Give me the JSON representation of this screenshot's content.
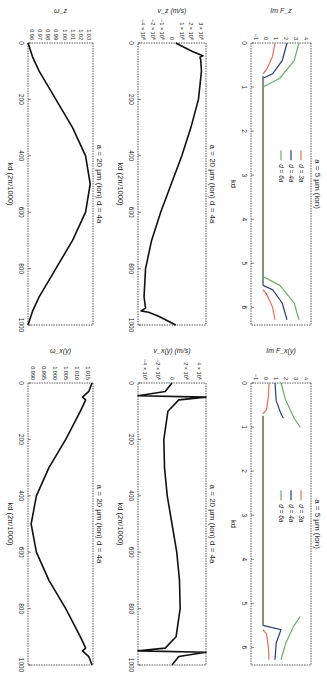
{
  "figure": {
    "orientation": "rotated 90 degrees clockwise",
    "layout": "2 rows x 3 columns"
  },
  "colors": {
    "axis": "#333333",
    "curve": "#111111",
    "d3a": "#e8705a",
    "d4a": "#2a3a7a",
    "d6a": "#6ab06a"
  },
  "chart_data": [
    {
      "id": "omega_z",
      "type": "line",
      "title": "a = 20 µm (ion) d = 4a",
      "xlabel": "kd (2π/1000)",
      "ylabel": "ω_z",
      "xlim": [
        0,
        1000
      ],
      "ylim": [
        0.96,
        1.03
      ],
      "xticks": [
        "0",
        "200",
        "400",
        "600",
        "800",
        "1000"
      ],
      "yticks": [
        "0.96",
        "0.97",
        "0.98",
        "0.99",
        "1.00",
        "1.01",
        "1.02",
        "1.03"
      ],
      "x": [
        0,
        50,
        100,
        200,
        300,
        400,
        500,
        600,
        700,
        800,
        900,
        950,
        1000
      ],
      "values": [
        0.96,
        0.965,
        0.972,
        0.99,
        1.008,
        1.022,
        1.027,
        1.022,
        1.008,
        0.99,
        0.972,
        0.965,
        0.96
      ]
    },
    {
      "id": "v_z",
      "type": "line",
      "title": "a = 20 µm (ion) d = 4a",
      "xlabel": "kd (2π/1000)",
      "ylabel": "v_z (m/s)",
      "xlim": [
        0,
        1000
      ],
      "ylim": [
        -5000000.0,
        4000000.0
      ],
      "xticks": [
        "0",
        "200",
        "400",
        "600",
        "800",
        "1000"
      ],
      "yticks": [
        "3 × 10⁶",
        "2 × 10⁶",
        "1 × 10⁶",
        "0",
        "−1 × 10⁶",
        "−2 × 10⁶",
        "−4 × 10⁶"
      ],
      "x": [
        0,
        30,
        45,
        50,
        60,
        100,
        200,
        300,
        400,
        500,
        600,
        700,
        800,
        900,
        940,
        950,
        955,
        970,
        1000
      ],
      "values": [
        0,
        2200000.0,
        3600000.0,
        3200000.0,
        3300000.0,
        3400000.0,
        3000000.0,
        2000000.0,
        800000.0,
        -600000.0,
        -2000000.0,
        -3200000.0,
        -4000000.0,
        -4200000.0,
        -4000000.0,
        -4600000.0,
        -3600000.0,
        -2200000.0,
        0
      ]
    },
    {
      "id": "im_F_z",
      "type": "line",
      "title": "a = 5 µm (ion)",
      "xlabel": "kd",
      "ylabel": "Im F_z",
      "xlim": [
        0,
        6.4
      ],
      "ylim": [
        -1,
        4
      ],
      "xticks": [
        "0",
        "1",
        "2",
        "3",
        "4",
        "5",
        "6"
      ],
      "yticks": [
        "−1",
        "0",
        "1",
        "2",
        "3",
        "4"
      ],
      "legend": [
        "d = 3a",
        "d = 4a",
        "d = 6a"
      ],
      "series": [
        {
          "name": "d = 3a",
          "x": [
            0,
            0.3,
            0.6,
            0.7,
            5.6,
            5.7,
            6.0,
            6.28
          ],
          "values": [
            1.0,
            0.8,
            0.3,
            0,
            0,
            0.3,
            0.8,
            1.0
          ]
        },
        {
          "name": "d = 4a",
          "x": [
            0,
            0.4,
            0.7,
            0.8,
            5.5,
            5.6,
            5.9,
            6.28
          ],
          "values": [
            2.0,
            1.6,
            0.8,
            0,
            0,
            0.8,
            1.6,
            2.0
          ]
        },
        {
          "name": "d = 6a",
          "x": [
            0,
            0.4,
            0.8,
            1.0,
            5.3,
            5.5,
            5.9,
            6.28
          ],
          "values": [
            3.0,
            2.6,
            1.4,
            0,
            0,
            1.4,
            2.6,
            3.0
          ]
        }
      ]
    },
    {
      "id": "omega_xy",
      "type": "line",
      "title": "a = 20 µm (ion) d = 4a",
      "xlabel": "kd (2π/1000)",
      "ylabel": "ω_x(y)",
      "xlim": [
        0,
        1000
      ],
      "ylim": [
        0.987,
        1.018
      ],
      "xticks": [
        "0",
        "200",
        "400",
        "600",
        "800",
        "1000"
      ],
      "yticks": [
        "0.990",
        "0.995",
        "1.000",
        "1.005",
        "1.010",
        "1.015"
      ],
      "x": [
        0,
        30,
        50,
        60,
        100,
        200,
        300,
        400,
        500,
        600,
        700,
        800,
        900,
        940,
        950,
        970,
        1000
      ],
      "values": [
        1.0175,
        1.016,
        1.013,
        1.0145,
        1.012,
        1.005,
        0.997,
        0.991,
        0.9885,
        0.991,
        0.997,
        1.005,
        1.012,
        1.0145,
        1.013,
        1.016,
        1.0175
      ]
    },
    {
      "id": "v_xy",
      "type": "line",
      "title": "a = 20 µm (ion) d = 4a",
      "xlabel": "kd (2π/1000)",
      "ylabel": "v_x(y) (m/s)",
      "xlim": [
        0,
        1000
      ],
      "ylim": [
        -5000000.0,
        5000000.0
      ],
      "xticks": [
        "0",
        "200",
        "400",
        "600",
        "800",
        "1000"
      ],
      "yticks": [
        "4 × 10⁶",
        "2 × 10⁶",
        "0",
        "−2 × 10⁶",
        "−4 × 10⁶"
      ],
      "x": [
        0,
        30,
        45,
        50,
        60,
        100,
        200,
        300,
        400,
        500,
        600,
        700,
        800,
        900,
        940,
        950,
        955,
        970,
        1000
      ],
      "values": [
        0,
        -1000000.0,
        -5000000.0,
        5000000.0,
        1000000.0,
        -600000.0,
        -1200000.0,
        -1100000.0,
        -700000.0,
        0,
        700000.0,
        1100000.0,
        1200000.0,
        600000.0,
        -1000000.0,
        -5000000.0,
        5000000.0,
        1000000.0,
        0
      ]
    },
    {
      "id": "im_F_xy",
      "type": "line",
      "title": "a = 5 µm (ion)",
      "xlabel": "kd",
      "ylabel": "Im F_x(y)",
      "xlim": [
        0,
        6.4
      ],
      "ylim": [
        -1,
        4
      ],
      "xticks": [
        "0",
        "1",
        "2",
        "3",
        "4",
        "5",
        "6"
      ],
      "yticks": [
        "−1",
        "0",
        "1",
        "2",
        "3",
        "4"
      ],
      "legend": [
        "d = 3a",
        "d = 4a",
        "d = 6a"
      ],
      "series": [
        {
          "name": "d = 3a",
          "x": [
            0,
            0.3,
            0.6,
            0.7,
            5.6,
            5.7,
            6.0,
            6.28
          ],
          "values": [
            0.5,
            0.45,
            0.3,
            0,
            0,
            0.3,
            0.45,
            0.5
          ]
        },
        {
          "name": "d = 4a",
          "x": [
            0,
            0.4,
            0.7,
            0.8,
            5.5,
            5.6,
            5.9,
            6.28
          ],
          "values": [
            1.0,
            1.1,
            1.5,
            1.7,
            0,
            1.5,
            1.1,
            1.0
          ]
        },
        {
          "name": "d = 6a",
          "x": [
            0,
            0.4,
            0.8,
            1.0,
            5.3,
            5.5,
            5.9,
            6.28
          ],
          "values": [
            1.5,
            1.9,
            2.6,
            3.1,
            3.1,
            2.6,
            1.9,
            1.5
          ]
        }
      ]
    }
  ]
}
